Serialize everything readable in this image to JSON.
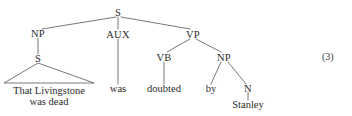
{
  "figure": {
    "equation_number": "(3)",
    "sentence": "That Livingstone was dead was doubted by Stanley",
    "colors": {
      "background": "#ffffff",
      "text": "#2b2b2b",
      "line": "#555555"
    }
  },
  "tree": {
    "root": {
      "label": "S",
      "x": 118,
      "y": 13
    },
    "nodes": [
      {
        "id": "np_subject",
        "label": "NP",
        "x": 38,
        "y": 34
      },
      {
        "id": "aux",
        "label": "AUX",
        "x": 118,
        "y": 35
      },
      {
        "id": "vp",
        "label": "VP",
        "x": 193,
        "y": 35
      },
      {
        "id": "s_embedded",
        "label": "S",
        "x": 38,
        "y": 59
      },
      {
        "id": "vb",
        "label": "VB",
        "x": 164,
        "y": 58
      },
      {
        "id": "np_object",
        "label": "NP",
        "x": 224,
        "y": 58
      },
      {
        "id": "n",
        "label": "N",
        "x": 248,
        "y": 89
      }
    ],
    "leaves": [
      {
        "id": "leaf_clause_line1",
        "label": "That Livingstone",
        "x": 49,
        "y": 92
      },
      {
        "id": "leaf_clause_line2",
        "label": "was dead",
        "x": 49,
        "y": 103
      },
      {
        "id": "leaf_was",
        "label": "was",
        "x": 118,
        "y": 90
      },
      {
        "id": "leaf_doubted",
        "label": "doubted",
        "x": 164,
        "y": 90
      },
      {
        "id": "leaf_by",
        "label": "by",
        "x": 211,
        "y": 90
      },
      {
        "id": "leaf_stanley",
        "label": "Stanley",
        "x": 248,
        "y": 106
      }
    ]
  }
}
